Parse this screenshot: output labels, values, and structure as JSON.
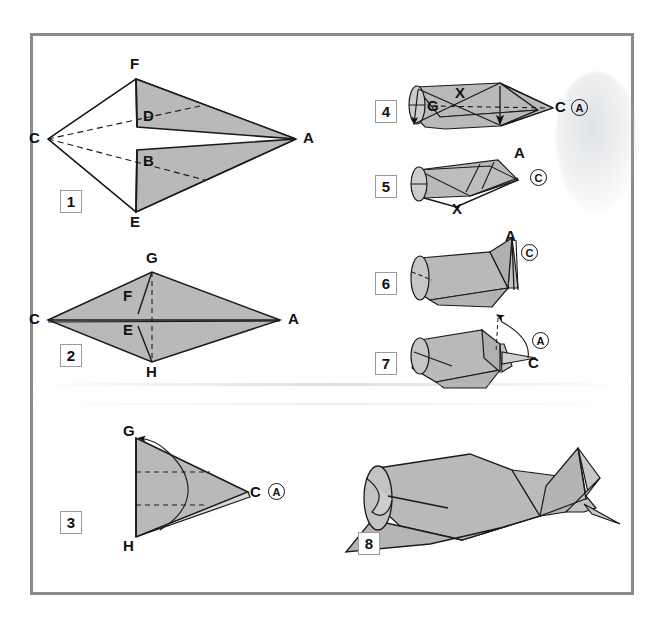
{
  "document": {
    "kind": "origami-instruction-sheet",
    "title": "Origami folding diagram - 8 steps",
    "frame_color": "#8a8a8a",
    "paper_fill": "#b9b9b9",
    "line_color": "#1a1a1a"
  },
  "steps": [
    {
      "number": "1",
      "name": "step-1",
      "labels": [
        "C",
        "F",
        "D",
        "B",
        "E",
        "A"
      ],
      "description": "Kite form with two shaded flaps folded toward centre line; dashed creases from C to A"
    },
    {
      "number": "2",
      "name": "step-2",
      "labels": [
        "C",
        "G",
        "F",
        "E",
        "A",
        "H"
      ],
      "description": "Flattened diamond, points G and H at top and bottom, C and A at left and right"
    },
    {
      "number": "3",
      "name": "step-3",
      "labels": [
        "G",
        "C",
        "A",
        "H"
      ],
      "description": "Folded triangle G-H-C with two dashed horizontal creases; curved arrow folds G down"
    },
    {
      "number": "4",
      "name": "step-4",
      "labels": [
        "G",
        "X",
        "C",
        "A"
      ],
      "description": "Rolled body seen in perspective, X marks crossing crease, arrow points down"
    },
    {
      "number": "5",
      "name": "step-5",
      "labels": [
        "A",
        "C",
        "X"
      ],
      "description": "Body with tail raised; point A upper right, C circled below"
    },
    {
      "number": "6",
      "name": "step-6",
      "labels": [
        "A",
        "C"
      ],
      "description": "Tail folded upright, A at tip, C circled at right"
    },
    {
      "number": "7",
      "name": "step-7",
      "labels": [
        "A",
        "C"
      ],
      "description": "Curved arrow folds head section over; A circled, C below"
    },
    {
      "number": "8",
      "name": "step-8",
      "labels": [],
      "description": "Completed model - finished bird / plane figure"
    }
  ],
  "circled_labels": [
    {
      "step": "3",
      "text": "A"
    },
    {
      "step": "4",
      "text": "A"
    },
    {
      "step": "5",
      "text": "C"
    },
    {
      "step": "6",
      "text": "C"
    },
    {
      "step": "7",
      "text": "A"
    }
  ],
  "plain_labels": {
    "s1": {
      "C": "C",
      "F": "F",
      "D": "D",
      "B": "B",
      "E": "E",
      "A": "A"
    },
    "s2": {
      "C": "C",
      "G": "G",
      "F": "F",
      "E": "E",
      "A": "A",
      "H": "H"
    },
    "s3": {
      "G": "G",
      "C": "C",
      "H": "H"
    },
    "s4": {
      "G": "G",
      "X": "X",
      "C": "C"
    },
    "s5": {
      "A": "A",
      "X": "X"
    },
    "s6": {
      "A": "A"
    },
    "s7": {
      "C": "C"
    }
  }
}
